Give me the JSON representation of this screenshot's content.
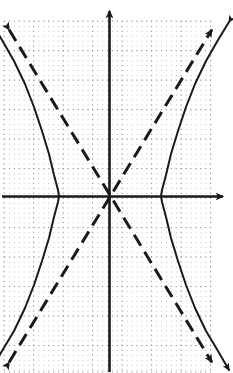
{
  "figure": {
    "title": "",
    "width": 233,
    "height": 373,
    "background_color": "#ffffff",
    "ink_color": "#1a1a1a",
    "grid_color": "#b9b9b9"
  },
  "chart_data": {
    "type": "line",
    "xlabel": "",
    "ylabel": "",
    "grid": true,
    "grid_style": "dotted",
    "legend": "none",
    "axes": {
      "origin_px": [
        110,
        196
      ],
      "unit_px": 29.5,
      "minor_dot_spacing_px": 4.9,
      "x_axis": {
        "name": "x-axis",
        "from_px": [
          4,
          196
        ],
        "to_px": [
          229,
          196
        ],
        "arrow_at": "right",
        "xlim": [
          -3.6,
          4.0
        ]
      },
      "y_axis": {
        "name": "y-axis",
        "from_px": [
          110,
          372
        ],
        "to_px": [
          110,
          5
        ],
        "arrow_at": "top",
        "ylim": [
          -6.0,
          6.5
        ]
      },
      "grid_extent_px": {
        "left": 4,
        "right": 213,
        "top": 21,
        "bottom": 372
      }
    },
    "series": [
      {
        "name": "hyperbola-right-branch",
        "style": "solid",
        "linewidth": 2,
        "arrow_at": "both",
        "equation": "x^2/a^2 - y^2/b^2 = 1",
        "vertex": [
          1.73,
          0
        ],
        "vertex_px": [
          161,
          196
        ],
        "points_px": [
          [
            229,
            22
          ],
          [
            218,
            40
          ],
          [
            206,
            61
          ],
          [
            195,
            84
          ],
          [
            186,
            107
          ],
          [
            178,
            131
          ],
          [
            171,
            154
          ],
          [
            166,
            175
          ],
          [
            162,
            190
          ],
          [
            161,
            196
          ],
          [
            162,
            202
          ],
          [
            166,
            217
          ],
          [
            171,
            238
          ],
          [
            178,
            261
          ],
          [
            186,
            285
          ],
          [
            195,
            308
          ],
          [
            206,
            331
          ],
          [
            218,
            351
          ],
          [
            229,
            370
          ]
        ]
      },
      {
        "name": "hyperbola-left-branch",
        "style": "solid",
        "linewidth": 2,
        "arrow_at": "both",
        "equation": "x^2/a^2 - y^2/b^2 = 1",
        "vertex": [
          -1.73,
          0
        ],
        "vertex_px": [
          59,
          196
        ],
        "points_px": [
          [
            -9,
            22
          ],
          [
            2,
            40
          ],
          [
            14,
            61
          ],
          [
            25,
            84
          ],
          [
            34,
            107
          ],
          [
            42,
            131
          ],
          [
            49,
            154
          ],
          [
            54,
            175
          ],
          [
            58,
            190
          ],
          [
            59,
            196
          ],
          [
            58,
            202
          ],
          [
            54,
            217
          ],
          [
            49,
            238
          ],
          [
            42,
            261
          ],
          [
            34,
            285
          ],
          [
            25,
            308
          ],
          [
            14,
            331
          ],
          [
            2,
            351
          ],
          [
            -9,
            370
          ]
        ]
      },
      {
        "name": "asymptote-positive-slope",
        "style": "dashed",
        "linewidth": 3,
        "arrow_at": "both",
        "slope": 1.63,
        "equation": "y = (b/a)x",
        "from_px": [
          5,
          369
        ],
        "to_px": [
          216,
          23
        ]
      },
      {
        "name": "asymptote-negative-slope",
        "style": "dashed",
        "linewidth": 3,
        "arrow_at": "both",
        "slope": -1.63,
        "equation": "y = -(b/a)x",
        "from_px": [
          5,
          23
        ],
        "to_px": [
          216,
          369
        ]
      }
    ],
    "x_major_gridlines": [
      -3.59,
      -2.59,
      -1.59,
      -0.59,
      0.41,
      1.41,
      2.41,
      3.49
    ],
    "y_major_gridlines": [
      5.93,
      4.93,
      3.93,
      2.93,
      1.93,
      0.93,
      -0.07,
      -1.07,
      -2.07,
      -3.07,
      -4.07,
      -5.07,
      -5.97
    ],
    "x_major_gridlines_px": [
      4,
      33.5,
      63,
      92.5,
      122,
      151.5,
      181,
      210.5
    ],
    "y_major_gridlines_px": [
      21,
      50.5,
      80,
      109.5,
      139,
      168.5,
      198,
      227.5,
      257,
      286.5,
      316,
      345.5,
      372
    ]
  }
}
